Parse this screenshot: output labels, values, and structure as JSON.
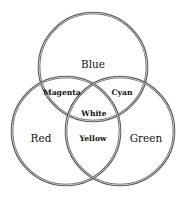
{
  "diagram": {
    "type": "venn",
    "circles": [
      {
        "id": "blue",
        "label": "Blue",
        "cx": 93,
        "cy": 67,
        "r": 54
      },
      {
        "id": "red",
        "label": "Red",
        "cx": 66,
        "cy": 131,
        "r": 54
      },
      {
        "id": "green",
        "label": "Green",
        "cx": 120,
        "cy": 131,
        "r": 54
      }
    ],
    "regions": {
      "blue": "Blue",
      "red": "Red",
      "green": "Green",
      "magenta": "Magenta",
      "cyan": "Cyan",
      "yellow": "Yellow",
      "white": "White"
    },
    "stroke_color": "#555555",
    "background": "#ffffff"
  }
}
